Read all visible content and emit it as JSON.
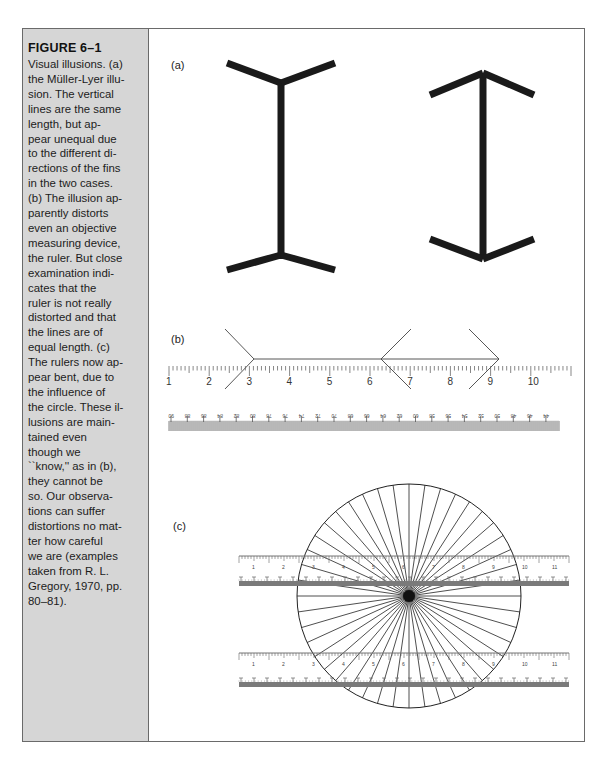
{
  "figure": {
    "label": "FIGURE 6–1",
    "caption": "Visual illusions. (a) the Müller-Lyer illusion. The vertical lines are the same length, but appear unequal due to the different directions of the fins in the two cases. (b) The illusion apparently distorts even an objective measuring device, the ruler. But close examination indicates that the ruler is not really distorted and that the lines are of equal length. (c) The rulers now appear bent, due to the influence of the circle. These illusions are maintained even though we ``know,'' as in (b), they cannot be so. Our observations can suffer distortions no matter how careful we are (examples taken from R. L. Gregory, 1970, pp. 80–81).",
    "caption_lines": [
      "Visual illusions. (a)",
      "the Müller-Lyer illu-",
      "sion. The vertical",
      "lines are the same",
      "length, but ap-",
      "pear unequal due",
      "to the different di-",
      "rections of the fins",
      "in the two cases.",
      "(b) The illusion ap-",
      "parently distorts",
      "even an objective",
      "measuring device,",
      "the ruler. But close",
      "examination indi-",
      "cates that the",
      "ruler is not really",
      "distorted and that",
      "the lines are of",
      "equal length. (c)",
      "The rulers now ap-",
      "pear bent, due to",
      "the influence of",
      "the circle. These il-",
      "lusions are main-",
      "tained even",
      "though we",
      "``know,'' as in (b),",
      "they cannot be",
      "so. Our observa-",
      "tions can suffer",
      "distortions no mat-",
      "ter how careful",
      "we are (examples",
      "taken from R. L.",
      "Gregory, 1970, pp.",
      "80–81)."
    ]
  },
  "panels": {
    "a": {
      "label": "(a)"
    },
    "b": {
      "label": "(b)",
      "ruler_numbers": [
        "1",
        "2",
        "3",
        "4",
        "5",
        "6",
        "7",
        "8",
        "9",
        "10"
      ]
    },
    "c": {
      "label": "(c)",
      "ruler_numbers": [
        "1",
        "2",
        "3",
        "4",
        "5",
        "6",
        "7",
        "8",
        "9",
        "10",
        "11"
      ]
    }
  },
  "colors": {
    "sidebar_bg": "#d6d6d6",
    "frame_border": "#6a6a6a",
    "ink": "#1a1a1a",
    "ruler_bar": "#7a7a7a"
  }
}
